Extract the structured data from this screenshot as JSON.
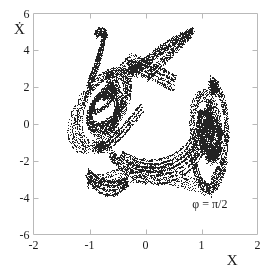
{
  "figure": {
    "background_color": "#ffffff",
    "frame_color": "#b9b9b9",
    "point_color": "#232323"
  },
  "chart_data": {
    "type": "scatter",
    "title": "",
    "subtitle": "",
    "xlabel": "X",
    "ylabel": "Ẋ",
    "xlim": [
      -2,
      2
    ],
    "ylim": [
      -6,
      6
    ],
    "grid": false,
    "legend": "none",
    "annotations": [
      {
        "text": "φ = π/2",
        "x": 1.15,
        "y": -4.35
      }
    ],
    "xticks": [
      -2,
      -1,
      0,
      1,
      2
    ],
    "xtick_labels": [
      "-2",
      "-1",
      "0",
      "1",
      "2"
    ],
    "yticks": [
      -6,
      -4,
      -2,
      0,
      2,
      4,
      6
    ],
    "ytick_labels": [
      "-6",
      "-4",
      "-2",
      "0",
      "2",
      "4",
      "6"
    ],
    "series": [
      {
        "name": "poincare-section",
        "marker": "dot",
        "marker_size": 1,
        "color": "#232323",
        "point_count": 9000,
        "description": "Strange attractor Poincare section with two spiral lobes",
        "x_range_observed": [
          -1.3,
          1.45
        ],
        "y_range_observed": [
          -3.6,
          5.1
        ]
      }
    ],
    "generator": {
      "note": "Point cloud reconstructed from the two-lobed folded-band attractor visible in the figure",
      "lobes": [
        {
          "name": "left-lobe",
          "center_x": -0.72,
          "center_y": 1.15,
          "spiral_turns": 2.6,
          "r_start": 0.12,
          "r_end": 0.62,
          "y_scale": 3.5,
          "rotation_deg": -28
        },
        {
          "name": "right-lobe",
          "center_x": 1.13,
          "center_y": -0.45,
          "spiral_turns": 2.4,
          "r_start": 0.07,
          "r_end": 0.33,
          "y_scale": 6.0,
          "rotation_deg": 10
        }
      ]
    }
  },
  "axes": {
    "x_axis_name": "X",
    "y_axis_name": "X-dot",
    "annotation_text": "φ = π/2"
  }
}
